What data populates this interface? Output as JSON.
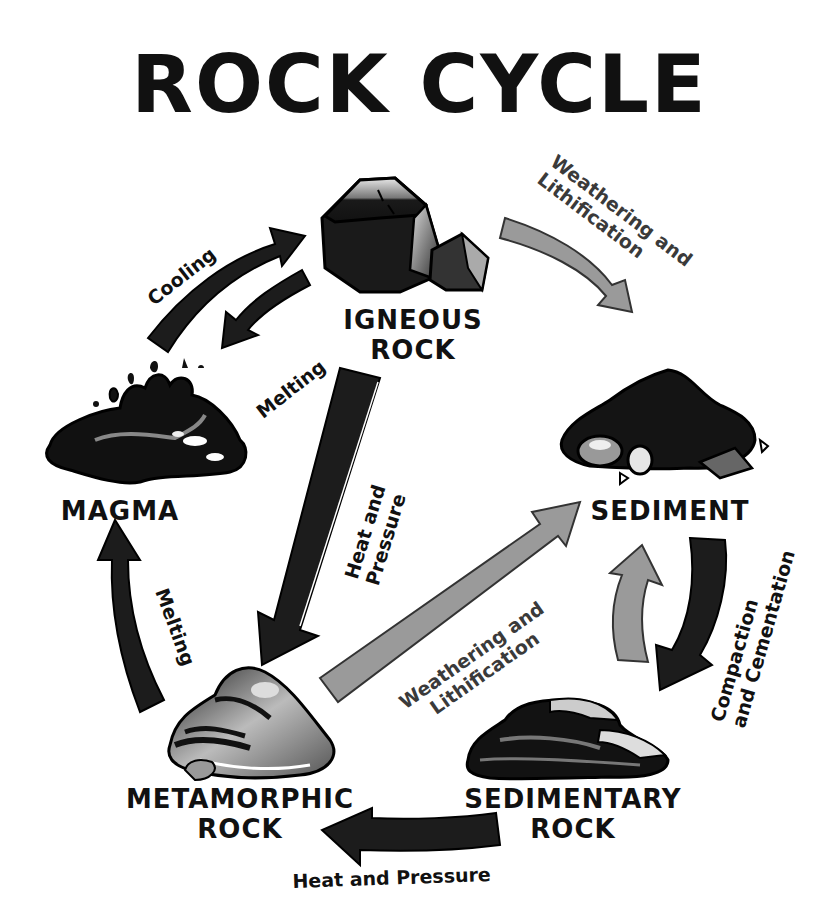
{
  "title": "ROCK CYCLE",
  "colors": {
    "dark_arrow": "#1c1c1c",
    "grey_arrow": "#9a9a9a",
    "text": "#111111",
    "background": "#ffffff"
  },
  "nodes": {
    "igneous": {
      "line1": "IGNEOUS",
      "line2": "ROCK",
      "icon": "igneous-rock-icon"
    },
    "sediment": {
      "line1": "SEDIMENT",
      "icon": "sediment-pile-icon"
    },
    "magma": {
      "line1": "MAGMA",
      "icon": "magma-puddle-icon"
    },
    "metamorphic": {
      "line1": "METAMORPHIC",
      "line2": "ROCK",
      "icon": "metamorphic-rock-icon"
    },
    "sedimentary": {
      "line1": "SEDIMENTARY",
      "line2": "ROCK",
      "icon": "sedimentary-rock-icon"
    }
  },
  "processes": {
    "cooling": {
      "line1": "Cooling",
      "from": "MAGMA",
      "to": "IGNEOUS ROCK",
      "arrow": "dark"
    },
    "melting_igneous": {
      "line1": "Melting",
      "from": "IGNEOUS ROCK",
      "to": "MAGMA",
      "arrow": "dark"
    },
    "weathering_igneous": {
      "line1": "Weathering and",
      "line2": "Lithification",
      "from": "IGNEOUS ROCK",
      "to": "SEDIMENT",
      "arrow": "grey"
    },
    "heat_pressure_igneous": {
      "line1": "Heat and",
      "line2": "Pressure",
      "from": "IGNEOUS ROCK",
      "to": "METAMORPHIC ROCK",
      "arrow": "dark"
    },
    "melting_metamorphic": {
      "line1": "Melting",
      "from": "METAMORPHIC ROCK",
      "to": "MAGMA",
      "arrow": "dark"
    },
    "weathering_metamorphic": {
      "line1": "Weathering and",
      "line2": "Lithification",
      "from": "METAMORPHIC ROCK",
      "to": "SEDIMENT",
      "arrow": "grey"
    },
    "weathering_sedimentary": {
      "from": "SEDIMENTARY ROCK",
      "to": "SEDIMENT",
      "arrow": "grey"
    },
    "compaction": {
      "line1": "Compaction",
      "line2": "and Cementation",
      "from": "SEDIMENT",
      "to": "SEDIMENTARY ROCK",
      "arrow": "dark"
    },
    "heat_pressure_sedimentary": {
      "line1": "Heat and Pressure",
      "from": "SEDIMENTARY ROCK",
      "to": "METAMORPHIC ROCK",
      "arrow": "dark"
    }
  }
}
